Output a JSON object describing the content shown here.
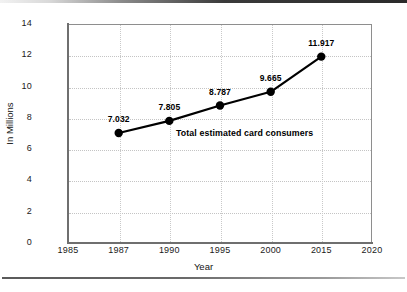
{
  "chart_data": {
    "type": "line",
    "title": "",
    "xlabel": "Year",
    "ylabel": "In Millions",
    "categories": [
      "1985",
      "1987",
      "1990",
      "1995",
      "2000",
      "2015",
      "2020"
    ],
    "x_tick_labels": [
      "1985",
      "1987",
      "1990",
      "1995",
      "2000",
      "2015",
      "2020"
    ],
    "y_tick_labels": [
      "0",
      "2",
      "4",
      "6",
      "8",
      "10",
      "12",
      "14"
    ],
    "y_ticks": [
      0,
      2,
      4,
      6,
      8,
      10,
      12,
      14
    ],
    "ylim": [
      0,
      14
    ],
    "grid": "dotted-both",
    "legend_position": "inline-annotation",
    "series": [
      {
        "name": "Total estimated card consumers",
        "marker": "filled-circle",
        "color": "#000000",
        "points": [
          {
            "x": "1987",
            "y": 7.032,
            "label": "7.032"
          },
          {
            "x": "1990",
            "y": 7.805,
            "label": "7.805"
          },
          {
            "x": "1995",
            "y": 8.787,
            "label": "8.787"
          },
          {
            "x": "2000",
            "y": 9.665,
            "label": "9.665"
          },
          {
            "x": "2015",
            "y": 11.917,
            "label": "11.917"
          }
        ]
      }
    ],
    "annotations": [
      {
        "text": "Total estimated card consumers"
      }
    ]
  }
}
